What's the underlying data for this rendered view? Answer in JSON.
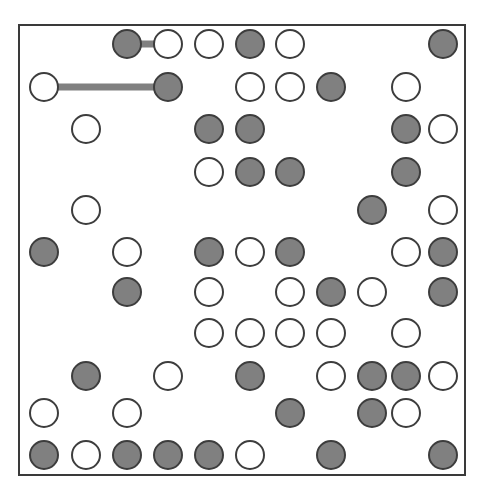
{
  "figure": {
    "kind": "node-grid-diagram",
    "background_color": "#ffffff",
    "frame": {
      "border_color": "#3a3a3a",
      "border_width": 2,
      "x": 18,
      "y": 24,
      "width": 448,
      "height": 452
    },
    "node_style": {
      "radius": 15,
      "filled_color": "#808080",
      "open_color": "#ffffff",
      "outline_color": "#3d3d3d",
      "outline_width": 2
    },
    "edge_style": {
      "color": "#808080",
      "width": 7
    }
  },
  "grid": {
    "columns": 11,
    "rows": 11,
    "column_x": [
      44,
      86,
      127,
      168,
      209,
      250,
      290,
      331,
      372,
      406,
      443
    ],
    "row_y": [
      44,
      87,
      129,
      172,
      210,
      252,
      292,
      333,
      376,
      413,
      455
    ]
  },
  "nodes": [
    {
      "id": "n1",
      "row": 1,
      "col": 3,
      "state": "filled"
    },
    {
      "id": "n2",
      "row": 1,
      "col": 4,
      "state": "open"
    },
    {
      "id": "n3",
      "row": 1,
      "col": 5,
      "state": "open"
    },
    {
      "id": "n4",
      "row": 1,
      "col": 6,
      "state": "filled"
    },
    {
      "id": "n5",
      "row": 1,
      "col": 7,
      "state": "open"
    },
    {
      "id": "n6",
      "row": 1,
      "col": 11,
      "state": "filled"
    },
    {
      "id": "n7",
      "row": 2,
      "col": 1,
      "state": "open"
    },
    {
      "id": "n8",
      "row": 2,
      "col": 4,
      "state": "filled"
    },
    {
      "id": "n9",
      "row": 2,
      "col": 6,
      "state": "open"
    },
    {
      "id": "n10",
      "row": 2,
      "col": 7,
      "state": "open"
    },
    {
      "id": "n11",
      "row": 2,
      "col": 8,
      "state": "filled"
    },
    {
      "id": "n12",
      "row": 2,
      "col": 10,
      "state": "open"
    },
    {
      "id": "n13",
      "row": 3,
      "col": 2,
      "state": "open"
    },
    {
      "id": "n14",
      "row": 3,
      "col": 5,
      "state": "filled"
    },
    {
      "id": "n15",
      "row": 3,
      "col": 6,
      "state": "filled"
    },
    {
      "id": "n16",
      "row": 3,
      "col": 10,
      "state": "filled"
    },
    {
      "id": "n17",
      "row": 3,
      "col": 11,
      "state": "open"
    },
    {
      "id": "n18",
      "row": 4,
      "col": 5,
      "state": "open"
    },
    {
      "id": "n19",
      "row": 4,
      "col": 6,
      "state": "filled"
    },
    {
      "id": "n20",
      "row": 4,
      "col": 7,
      "state": "filled"
    },
    {
      "id": "n21",
      "row": 4,
      "col": 10,
      "state": "filled"
    },
    {
      "id": "n22",
      "row": 5,
      "col": 2,
      "state": "open"
    },
    {
      "id": "n23",
      "row": 5,
      "col": 9,
      "state": "filled"
    },
    {
      "id": "n24",
      "row": 5,
      "col": 11,
      "state": "open"
    },
    {
      "id": "n25",
      "row": 6,
      "col": 1,
      "state": "filled"
    },
    {
      "id": "n26",
      "row": 6,
      "col": 3,
      "state": "open"
    },
    {
      "id": "n27",
      "row": 6,
      "col": 5,
      "state": "filled"
    },
    {
      "id": "n28",
      "row": 6,
      "col": 6,
      "state": "open"
    },
    {
      "id": "n29",
      "row": 6,
      "col": 7,
      "state": "filled"
    },
    {
      "id": "n30",
      "row": 6,
      "col": 10,
      "state": "open"
    },
    {
      "id": "n31",
      "row": 6,
      "col": 11,
      "state": "filled"
    },
    {
      "id": "n32",
      "row": 7,
      "col": 3,
      "state": "filled"
    },
    {
      "id": "n33",
      "row": 7,
      "col": 5,
      "state": "open"
    },
    {
      "id": "n34",
      "row": 7,
      "col": 7,
      "state": "open"
    },
    {
      "id": "n35",
      "row": 7,
      "col": 8,
      "state": "filled"
    },
    {
      "id": "n36",
      "row": 7,
      "col": 9,
      "state": "open"
    },
    {
      "id": "n37",
      "row": 7,
      "col": 11,
      "state": "filled"
    },
    {
      "id": "n38",
      "row": 8,
      "col": 5,
      "state": "open"
    },
    {
      "id": "n39",
      "row": 8,
      "col": 6,
      "state": "open"
    },
    {
      "id": "n40",
      "row": 8,
      "col": 7,
      "state": "open"
    },
    {
      "id": "n41",
      "row": 8,
      "col": 8,
      "state": "open"
    },
    {
      "id": "n42",
      "row": 8,
      "col": 10,
      "state": "open"
    },
    {
      "id": "n43",
      "row": 9,
      "col": 2,
      "state": "filled"
    },
    {
      "id": "n44",
      "row": 9,
      "col": 4,
      "state": "open"
    },
    {
      "id": "n45",
      "row": 9,
      "col": 6,
      "state": "filled"
    },
    {
      "id": "n46",
      "row": 9,
      "col": 8,
      "state": "open"
    },
    {
      "id": "n47",
      "row": 9,
      "col": 9,
      "state": "filled"
    },
    {
      "id": "n48",
      "row": 9,
      "col": 10,
      "state": "filled"
    },
    {
      "id": "n49",
      "row": 9,
      "col": 11,
      "state": "open"
    },
    {
      "id": "n50",
      "row": 10,
      "col": 1,
      "state": "open"
    },
    {
      "id": "n51",
      "row": 10,
      "col": 3,
      "state": "open"
    },
    {
      "id": "n52",
      "row": 10,
      "col": 7,
      "state": "filled"
    },
    {
      "id": "n53",
      "row": 10,
      "col": 9,
      "state": "filled"
    },
    {
      "id": "n54",
      "row": 10,
      "col": 10,
      "state": "open"
    },
    {
      "id": "n55",
      "row": 11,
      "col": 1,
      "state": "filled"
    },
    {
      "id": "n56",
      "row": 11,
      "col": 2,
      "state": "open"
    },
    {
      "id": "n57",
      "row": 11,
      "col": 3,
      "state": "filled"
    },
    {
      "id": "n58",
      "row": 11,
      "col": 4,
      "state": "filled"
    },
    {
      "id": "n59",
      "row": 11,
      "col": 5,
      "state": "filled"
    },
    {
      "id": "n60",
      "row": 11,
      "col": 6,
      "state": "open"
    },
    {
      "id": "n61",
      "row": 11,
      "col": 8,
      "state": "filled"
    },
    {
      "id": "n62",
      "row": 11,
      "col": 11,
      "state": "filled"
    }
  ],
  "edges": [
    {
      "id": "e1",
      "from": "n1",
      "to": "n2"
    },
    {
      "id": "e2",
      "from": "n7",
      "to": "n8"
    }
  ]
}
